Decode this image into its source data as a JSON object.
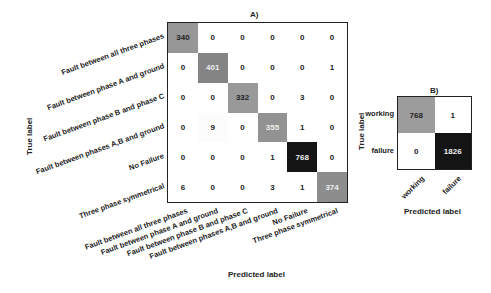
{
  "chart_data": [
    {
      "type": "heatmap",
      "title": "A)",
      "xlabel": "Predicted label",
      "ylabel": "True label",
      "categories": [
        "Fault between all three phases",
        "Fault between phase A and ground",
        "Fault between phase B and phase C",
        "Fault between phases A,B and ground",
        "No Failure",
        "Three  phase symmetrical"
      ],
      "values": [
        [
          340,
          0,
          0,
          0,
          0,
          0
        ],
        [
          0,
          401,
          0,
          0,
          0,
          1
        ],
        [
          0,
          0,
          332,
          0,
          3,
          0
        ],
        [
          0,
          9,
          0,
          355,
          1,
          0
        ],
        [
          0,
          0,
          0,
          1,
          768,
          0
        ],
        [
          6,
          0,
          0,
          3,
          1,
          374
        ]
      ],
      "colormap": "greys",
      "legend": "none"
    },
    {
      "type": "heatmap",
      "title": "B)",
      "xlabel": "Predicted label",
      "ylabel": "True label",
      "categories": [
        "working",
        "failure"
      ],
      "values": [
        [
          768,
          1
        ],
        [
          0,
          1826
        ]
      ],
      "colormap": "greys",
      "legend": "none"
    }
  ],
  "labels": {
    "a_title": "A)",
    "b_title": "B)",
    "predicted": "Predicted label",
    "true": "True label"
  }
}
